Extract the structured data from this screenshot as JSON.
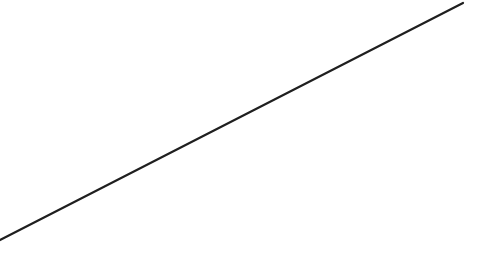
{
  "canvas": {
    "background": "#ffffff",
    "line": {
      "x1": 0,
      "y1": 240,
      "x2": 463,
      "y2": 3,
      "color": "#1f1f1f",
      "width": 2.2
    }
  }
}
